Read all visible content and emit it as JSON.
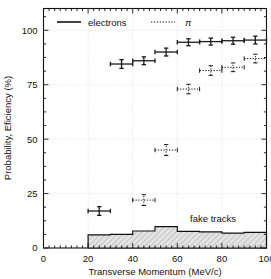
{
  "chart_data": {
    "type": "scatter",
    "title": "",
    "xlabel": "Transverse Momentum (MeV/c)",
    "ylabel": "Probability, Eficiency (%)",
    "xlim": [
      0,
      100
    ],
    "ylim": [
      0,
      110
    ],
    "xticks": [
      0,
      20,
      40,
      60,
      80,
      100
    ],
    "yticks": [
      0,
      25,
      50,
      75,
      100
    ],
    "xtick_labels": [
      "0",
      "20",
      "40",
      "60",
      "80",
      "100"
    ],
    "ytick_labels": [
      "0",
      "25",
      "50",
      "75",
      "100"
    ],
    "grid": true,
    "grid_style": "dotted",
    "legend_position": "top-left",
    "legend": [
      {
        "label": "electrons",
        "marker": "solid-line-errorbar"
      },
      {
        "label": "π",
        "marker": "dotted-line-errorbar"
      }
    ],
    "annotations": [
      {
        "text": "fake tracks",
        "x": 77,
        "y": 13
      }
    ],
    "series": [
      {
        "name": "electrons",
        "style": "solid",
        "points": [
          {
            "x": 25,
            "y": 17,
            "xerr": 5,
            "yerr": 2.0
          },
          {
            "x": 35,
            "y": 84.5,
            "xerr": 5,
            "yerr": 2.0
          },
          {
            "x": 45,
            "y": 86,
            "xerr": 5,
            "yerr": 1.8
          },
          {
            "x": 55,
            "y": 90,
            "xerr": 5,
            "yerr": 1.8
          },
          {
            "x": 65,
            "y": 94.5,
            "xerr": 5,
            "yerr": 1.6
          },
          {
            "x": 75,
            "y": 94.8,
            "xerr": 5,
            "yerr": 1.6
          },
          {
            "x": 85,
            "y": 95.2,
            "xerr": 5,
            "yerr": 1.6
          },
          {
            "x": 95,
            "y": 95.5,
            "xerr": 5,
            "yerr": 1.8
          }
        ]
      },
      {
        "name": "π",
        "style": "dotted",
        "points": [
          {
            "x": 45,
            "y": 22,
            "xerr": 5,
            "yerr": 2.5
          },
          {
            "x": 55,
            "y": 45,
            "xerr": 5,
            "yerr": 2.5
          },
          {
            "x": 65,
            "y": 73,
            "xerr": 5,
            "yerr": 2.2
          },
          {
            "x": 75,
            "y": 81.5,
            "xerr": 5,
            "yerr": 2.2
          },
          {
            "x": 85,
            "y": 83,
            "xerr": 5,
            "yerr": 2.0
          },
          {
            "x": 95,
            "y": 87,
            "xerr": 5,
            "yerr": 2.0
          }
        ]
      }
    ],
    "histogram": {
      "name": "fake tracks",
      "fill": "hatched",
      "bin_edges": [
        20,
        30,
        40,
        50,
        60,
        70,
        80,
        90,
        100
      ],
      "bin_values": [
        6.0,
        6.3,
        7.8,
        9.8,
        7.6,
        7.4,
        6.8,
        7.2
      ]
    }
  },
  "colors": {
    "axis": "#111111",
    "grid": "#c8c8c8",
    "data": "#1a1a1a",
    "hatch_fill": "#d9d9d9",
    "background": "#ffffff"
  }
}
